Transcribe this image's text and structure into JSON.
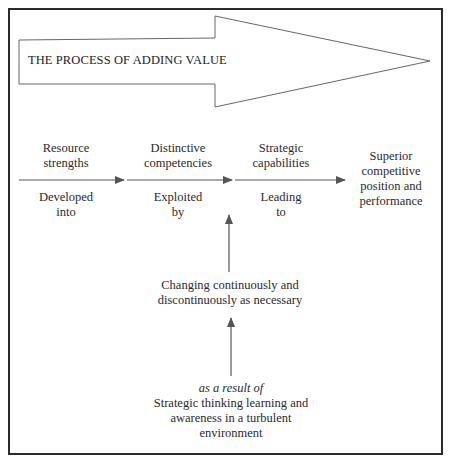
{
  "diagram": {
    "title": "THE PROCESS OF ADDING VALUE",
    "stages": [
      {
        "label": "Resource\nstrengths",
        "connector": "Developed\ninto"
      },
      {
        "label": "Distinctive\ncompetencies",
        "connector": "Exploited\nby"
      },
      {
        "label": "Strategic\ncapabilities",
        "connector": "Leading\nto"
      },
      {
        "label": "Superior\ncompetitive\nposition and\nperformance"
      }
    ],
    "change_node": "Changing continuously and\ndiscontinuously as necessary",
    "cause_prefix": "as a result of",
    "cause_node": "Strategic thinking learning and\nawareness in a turbulent\nenvironment",
    "colors": {
      "frame": "#2b2b2b",
      "arrow_stroke": "#555555",
      "text": "#2a2a2a"
    }
  }
}
